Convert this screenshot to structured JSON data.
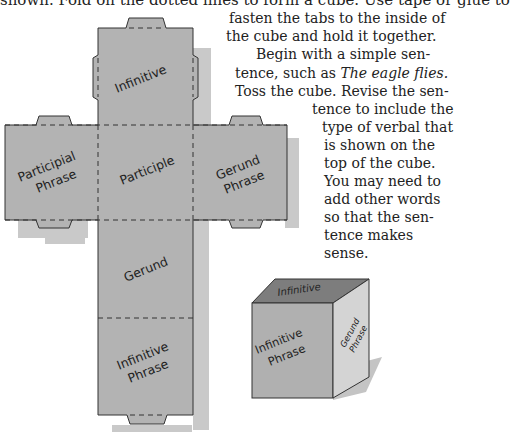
{
  "instructions": {
    "top_line": "shown. Fold on the dotted lines to form a cube. Use tape or glue to",
    "lines": [
      "fasten the tabs to the inside of",
      "the cube and hold it together.",
      "Begin with a simple sen-",
      "tence, such as ",
      "Toss the cube. Revise the sen-",
      "tence to include the",
      "type of verbal that",
      "is shown on the",
      "top of the cube.",
      "You may need to",
      "add other words",
      "so that the sen-",
      "tence makes",
      "sense."
    ],
    "example_sentence": "The eagle flies."
  },
  "cube_net": {
    "faces": {
      "top": "Infinitive",
      "left": [
        "Participial",
        "Phrase"
      ],
      "center": "Participle",
      "right": [
        "Gerund",
        "Phrase"
      ],
      "lower": "Gerund",
      "bottom": [
        "Infinitive",
        "Phrase"
      ]
    },
    "colors": {
      "face": "#b3b3b3",
      "shadow": "#c9c9c9",
      "outline": "#333333"
    }
  },
  "folded_cube": {
    "top": "Infinitive",
    "front": [
      "Infinitive",
      "Phrase"
    ],
    "side": [
      "Gerund",
      "Phrase"
    ],
    "colors": {
      "top": "#7d7d7d",
      "front": "#b0b0b0",
      "side": "#d4d4d4",
      "shadow": "#c4c4c4"
    }
  }
}
